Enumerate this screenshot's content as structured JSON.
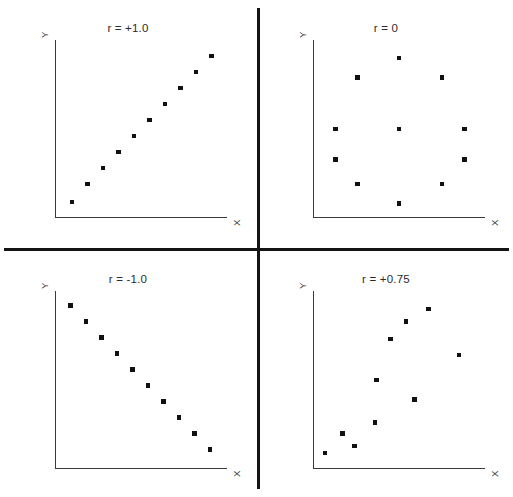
{
  "figure": {
    "width": 513,
    "height": 497,
    "background": "#ffffff",
    "divider_color": "#141414",
    "axis_color": "#3a3a3a",
    "marker_color": "#111111"
  },
  "chart_data": [
    {
      "type": "scatter",
      "title": "r = +1.0",
      "xlabel": "X",
      "ylabel": "Y",
      "xlim": [
        0,
        10
      ],
      "ylim": [
        0,
        10
      ],
      "grid": false,
      "legend": "none",
      "correlation": 1.0,
      "points": [
        {
          "x": 1.0,
          "y": 0.9
        },
        {
          "x": 1.9,
          "y": 1.9
        },
        {
          "x": 2.8,
          "y": 2.8
        },
        {
          "x": 3.7,
          "y": 3.7
        },
        {
          "x": 4.6,
          "y": 4.6
        },
        {
          "x": 5.5,
          "y": 5.5
        },
        {
          "x": 6.4,
          "y": 6.4
        },
        {
          "x": 7.3,
          "y": 7.3
        },
        {
          "x": 8.2,
          "y": 8.2
        },
        {
          "x": 9.1,
          "y": 9.1
        }
      ]
    },
    {
      "type": "scatter",
      "title": "r = 0",
      "xlabel": "X",
      "ylabel": "Y",
      "xlim": [
        0,
        10
      ],
      "ylim": [
        0,
        10
      ],
      "grid": false,
      "legend": "none",
      "correlation": 0.0,
      "points": [
        {
          "x": 5.0,
          "y": 9.0
        },
        {
          "x": 2.6,
          "y": 7.9
        },
        {
          "x": 7.5,
          "y": 7.9
        },
        {
          "x": 1.3,
          "y": 5.0
        },
        {
          "x": 5.0,
          "y": 5.0
        },
        {
          "x": 8.8,
          "y": 5.0
        },
        {
          "x": 1.3,
          "y": 3.3
        },
        {
          "x": 8.8,
          "y": 3.3
        },
        {
          "x": 2.6,
          "y": 1.9
        },
        {
          "x": 7.5,
          "y": 1.9
        },
        {
          "x": 5.0,
          "y": 0.8
        }
      ]
    },
    {
      "type": "scatter",
      "title": "r = -1.0",
      "xlabel": "X",
      "ylabel": "Y",
      "xlim": [
        0,
        10
      ],
      "ylim": [
        0,
        10
      ],
      "grid": false,
      "legend": "none",
      "correlation": -1.0,
      "points": [
        {
          "x": 0.9,
          "y": 9.2
        },
        {
          "x": 1.8,
          "y": 8.3
        },
        {
          "x": 2.7,
          "y": 7.4
        },
        {
          "x": 3.6,
          "y": 6.5
        },
        {
          "x": 4.5,
          "y": 5.6
        },
        {
          "x": 5.4,
          "y": 4.7
        },
        {
          "x": 6.3,
          "y": 3.8
        },
        {
          "x": 7.2,
          "y": 2.9
        },
        {
          "x": 8.1,
          "y": 2.0
        },
        {
          "x": 9.0,
          "y": 1.1
        }
      ]
    },
    {
      "type": "scatter",
      "title": "r = +0.75",
      "xlabel": "X",
      "ylabel": "Y",
      "xlim": [
        0,
        10
      ],
      "ylim": [
        0,
        10
      ],
      "grid": false,
      "legend": "none",
      "correlation": 0.75,
      "points": [
        {
          "x": 0.7,
          "y": 0.9
        },
        {
          "x": 1.7,
          "y": 2.0
        },
        {
          "x": 2.4,
          "y": 1.3
        },
        {
          "x": 3.6,
          "y": 2.6
        },
        {
          "x": 3.7,
          "y": 5.0
        },
        {
          "x": 4.5,
          "y": 7.3
        },
        {
          "x": 5.4,
          "y": 8.3
        },
        {
          "x": 5.9,
          "y": 3.9
        },
        {
          "x": 6.7,
          "y": 9.0
        },
        {
          "x": 8.5,
          "y": 6.4
        }
      ]
    }
  ],
  "panels": [
    {
      "id": "r-plus-one",
      "title": "r = +1.0",
      "xlabel": "X",
      "ylabel": "Y"
    },
    {
      "id": "r-zero",
      "title": "r = 0",
      "xlabel": "X",
      "ylabel": "Y"
    },
    {
      "id": "r-minus-one",
      "title": "r = -1.0",
      "xlabel": "X",
      "ylabel": "Y"
    },
    {
      "id": "r-plus-point-seven-five",
      "title": "r = +0.75",
      "xlabel": "X",
      "ylabel": "Y"
    }
  ]
}
